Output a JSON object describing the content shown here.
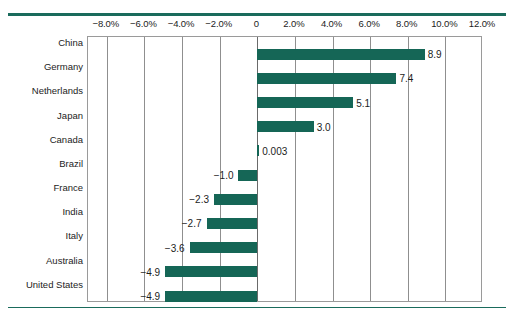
{
  "chart_data": {
    "type": "bar",
    "orientation": "horizontal",
    "title": "",
    "subtitle": "",
    "xlabel": "",
    "ylabel": "",
    "xlim": [
      -9.0,
      12.0
    ],
    "grid": true,
    "legend": "none",
    "value_suffix": "",
    "axis_tick_labels": [
      "−8.0%",
      "−6.0%",
      "−4.0%",
      "−2.0%",
      "0",
      "2.0%",
      "4.0%",
      "6.0%",
      "8.0%",
      "10.0%",
      "12.0%"
    ],
    "axis_tick_values": [
      -8,
      -6,
      -4,
      -2,
      0,
      2,
      4,
      6,
      8,
      10,
      12
    ],
    "categories": [
      "China",
      "Germany",
      "Netherlands",
      "Japan",
      "Canada",
      "Brazil",
      "France",
      "India",
      "Italy",
      "Australia",
      "United States"
    ],
    "values": [
      8.9,
      7.4,
      5.1,
      3.0,
      0.003,
      -1.0,
      -2.3,
      -2.7,
      -3.6,
      -4.9,
      -4.9
    ],
    "data_labels": [
      "8.9",
      "7.4",
      "5.1",
      "3.0",
      "0.003",
      "−1.0",
      "−2.3",
      "−2.7",
      "−3.6",
      "−4.9",
      "−4.9"
    ],
    "colors": {
      "bar": "#156656",
      "rule": "#1a6b5c",
      "frame": "#9a9a9a",
      "gridline": "#8f8f8f",
      "text": "#1c1c1c",
      "background": "#ffffff"
    }
  }
}
